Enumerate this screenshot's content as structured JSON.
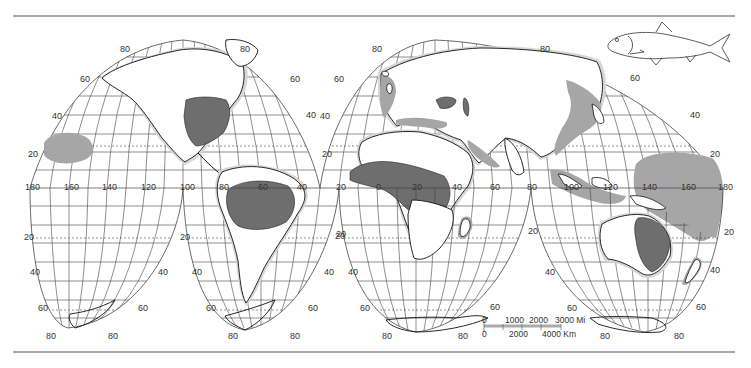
{
  "map": {
    "projection": "Interrupted homolosine (Goode)",
    "colors": {
      "background": "#ffffff",
      "rule": "#555555",
      "graticule": "#444444",
      "coast": "#111111",
      "range_dark": "#6e6e6e",
      "range_light": "#a6a6a6",
      "halo": "#cfcfcf"
    },
    "latitude_labels": {
      "north": [
        "80",
        "60",
        "40",
        "20"
      ],
      "south": [
        "20",
        "40",
        "60",
        "80"
      ]
    },
    "longitude_labels": [
      "180",
      "160",
      "140",
      "120",
      "100",
      "80",
      "60",
      "40",
      "20",
      "0",
      "20",
      "40",
      "60",
      "80",
      "100",
      "120",
      "140",
      "160",
      "180"
    ],
    "shaded_regions": [
      "Eastern North America (Mississippi basin / Atlantic coast)",
      "Central Pacific west of Baja",
      "Amazon basin",
      "West & Central Africa (Niger / Congo basins)",
      "Black Sea & Caspian region",
      "European Atlantic & Mediterranean coasts",
      "East & Southeast Asia coasts",
      "Eastern Australia (Murray-Darling)",
      "Western & Central Pacific",
      "New Zealand coast",
      "Madagascar coast"
    ],
    "scale_bar": {
      "miles_labels": [
        "0",
        "1000",
        "2000",
        "3000 Mi"
      ],
      "km_labels": [
        "0",
        "2000",
        "4000 Km"
      ]
    },
    "fish_illustration": "herring-like fish (side view)"
  }
}
